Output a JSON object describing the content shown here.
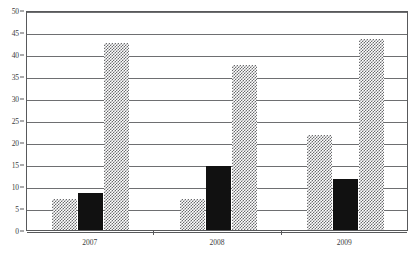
{
  "chart_data": {
    "type": "bar",
    "title": "",
    "subtitle": "",
    "xlabel": "",
    "ylabel": "",
    "categories": [
      "2007",
      "2008",
      "2009"
    ],
    "series": [
      {
        "name": "series-1",
        "values": [
          7,
          7,
          21.5
        ],
        "fill": "hatch",
        "color": "#6b6c6e"
      },
      {
        "name": "series-2",
        "values": [
          8.3,
          14.5,
          11.5
        ],
        "fill": "solid",
        "color": "#111111"
      },
      {
        "name": "series-3",
        "values": [
          42.5,
          37.5,
          43.5
        ],
        "fill": "hatch",
        "color": "#6b6c6e"
      }
    ],
    "ylim": [
      0,
      50
    ],
    "ytick_step": 5,
    "yticks": [
      "0",
      "5",
      "10",
      "15",
      "20",
      "25",
      "30",
      "35",
      "40",
      "45",
      "50"
    ],
    "grid": true,
    "grid_axis": "y",
    "legend": false,
    "legend_position": "none",
    "frame": true,
    "colors": {
      "axis": "#58595b",
      "grid": "#6e6f71",
      "tick_text": "#3b3b3d",
      "background": "#ffffff",
      "bar_hatch": "#6b6c6e",
      "bar_solid": "#111111"
    }
  }
}
